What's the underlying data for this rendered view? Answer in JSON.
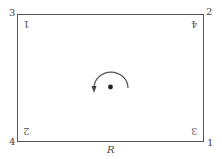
{
  "diagram": {
    "region_label": "R",
    "corner_labels": {
      "top_left": "3",
      "top_right": "2",
      "bottom_left": "4",
      "bottom_right": "1"
    },
    "inner_labels_rotated_180": {
      "top_left": "1",
      "top_right": "4",
      "bottom_left": "2",
      "bottom_right": "3"
    },
    "center": {
      "marker": "dot",
      "rotation_arrow": "counter-clockwise semicircle arrow",
      "rotation_angle_deg": 180
    },
    "colors": {
      "stroke": "#555555",
      "text": "#444444",
      "background": "#ffffff"
    }
  }
}
